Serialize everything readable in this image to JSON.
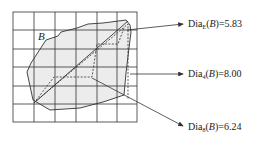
{
  "figure": {
    "region_label": "B",
    "grid": {
      "x0": 13,
      "y0": 12,
      "cols": 6,
      "rows": 6,
      "cell_w": 20.7,
      "cell_h": 18.3
    },
    "annotations": [
      {
        "name": "Dia",
        "sub": "E",
        "arg": "B",
        "value": "5.83",
        "y": 24
      },
      {
        "name": "Dia",
        "sub": "4",
        "arg": "B",
        "value": "8.00",
        "y": 74
      },
      {
        "name": "Dia",
        "sub": "8",
        "arg": "B",
        "value": "6.24",
        "y": 128
      }
    ],
    "colors": {
      "fill": "#ececec",
      "stroke": "#333333"
    }
  }
}
